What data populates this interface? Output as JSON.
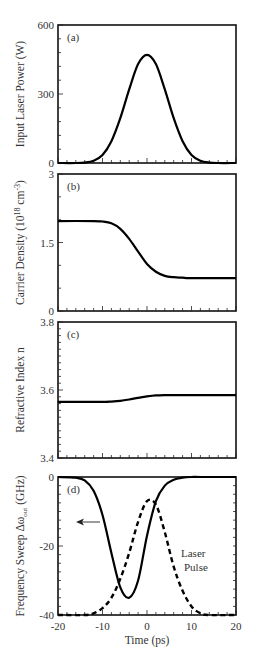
{
  "figure": {
    "x_axis": {
      "label": "Time (ps)",
      "range": [
        -20,
        20
      ],
      "ticks": [
        "-20",
        "-10",
        "0",
        "10",
        "20"
      ]
    },
    "panels": [
      {
        "tag": "(a)",
        "ylabel": "Input Laser Power (W)",
        "ylim": [
          0,
          600
        ],
        "yticks": [
          "0",
          "300",
          "600"
        ]
      },
      {
        "tag": "(b)",
        "ylabel_main": "Carrier Density (10",
        "ylabel_sup1": "18",
        "ylabel_mid": " cm",
        "ylabel_sup2": "-3",
        "ylabel_end": ")",
        "ylim": [
          0,
          3
        ],
        "yticks": [
          "0",
          "1.5",
          "3"
        ]
      },
      {
        "tag": "(c)",
        "ylabel": "Refractive Index n",
        "ylim": [
          3.4,
          3.8
        ],
        "yticks": [
          "3.4",
          "3.6",
          "3.8"
        ]
      },
      {
        "tag": "(d)",
        "ylabel_main": "Frequency Sweep Δω",
        "ylabel_sub": "out",
        "ylabel_end": " (GHz)",
        "ylim": [
          -40,
          0
        ],
        "yticks": [
          "-40",
          "-20",
          "0"
        ],
        "annotation_line1": "Laser",
        "annotation_line2": "Pulse"
      }
    ]
  },
  "chart_data": [
    {
      "type": "line",
      "title": "(a)",
      "xlabel": "Time (ps)",
      "ylabel": "Input Laser Power (W)",
      "xlim": [
        -20,
        20
      ],
      "ylim": [
        0,
        600
      ],
      "grid": false,
      "series": [
        {
          "name": "Input laser power",
          "style": "solid",
          "x": [
            -20,
            -16,
            -14,
            -12,
            -10,
            -8,
            -6,
            -4,
            -2,
            0,
            2,
            4,
            6,
            8,
            10,
            12,
            14,
            16,
            20
          ],
          "y": [
            0,
            0,
            2,
            10,
            35,
            95,
            195,
            320,
            430,
            470,
            430,
            320,
            195,
            95,
            35,
            10,
            2,
            0,
            0
          ]
        }
      ]
    },
    {
      "type": "line",
      "title": "(b)",
      "xlabel": "Time (ps)",
      "ylabel": "Carrier Density (10^18 cm^-3)",
      "xlim": [
        -20,
        20
      ],
      "ylim": [
        0,
        3
      ],
      "grid": false,
      "series": [
        {
          "name": "Carrier density",
          "style": "solid",
          "x": [
            -20,
            -12,
            -10,
            -8,
            -6,
            -4,
            -2,
            0,
            2,
            4,
            6,
            8,
            10,
            20
          ],
          "y": [
            1.97,
            1.97,
            1.96,
            1.92,
            1.8,
            1.58,
            1.3,
            1.03,
            0.86,
            0.77,
            0.74,
            0.73,
            0.72,
            0.72
          ]
        }
      ]
    },
    {
      "type": "line",
      "title": "(c)",
      "xlabel": "Time (ps)",
      "ylabel": "Refractive Index n",
      "xlim": [
        -20,
        20
      ],
      "ylim": [
        3.4,
        3.8
      ],
      "grid": false,
      "series": [
        {
          "name": "Refractive index",
          "style": "solid",
          "x": [
            -20,
            -10,
            -8,
            -6,
            -4,
            -2,
            0,
            2,
            4,
            6,
            20
          ],
          "y": [
            3.565,
            3.565,
            3.566,
            3.568,
            3.572,
            3.577,
            3.581,
            3.584,
            3.585,
            3.585,
            3.585
          ]
        }
      ]
    },
    {
      "type": "line",
      "title": "(d)",
      "xlabel": "Time (ps)",
      "ylabel": "Frequency Sweep Δω_out (GHz)",
      "xlim": [
        -20,
        20
      ],
      "ylim": [
        -40,
        0
      ],
      "grid": false,
      "annotations": [
        "← (arrow pointing to left axis)",
        "Laser Pulse"
      ],
      "series": [
        {
          "name": "Frequency sweep",
          "style": "solid",
          "x": [
            -20,
            -16,
            -14,
            -12,
            -10,
            -8,
            -6,
            -4,
            -2,
            0,
            2,
            4,
            6,
            8,
            10,
            12,
            20
          ],
          "y": [
            0,
            -0.2,
            -1,
            -4,
            -11,
            -22,
            -32,
            -35,
            -30,
            -17,
            -7,
            -2.5,
            -0.8,
            -0.2,
            0,
            0,
            0
          ]
        },
        {
          "name": "Laser Pulse",
          "style": "dashed",
          "axis": "relative (normalized pulse shape)",
          "x": [
            -20,
            -14,
            -12,
            -10,
            -8,
            -6,
            -4,
            -2,
            0,
            2,
            4,
            6,
            8,
            10,
            12,
            14,
            20
          ],
          "y": [
            -40,
            -40,
            -39.5,
            -38,
            -35,
            -29.5,
            -22,
            -13,
            -7,
            -8,
            -16,
            -26,
            -33,
            -37.5,
            -39.5,
            -40,
            -40
          ]
        }
      ]
    }
  ]
}
